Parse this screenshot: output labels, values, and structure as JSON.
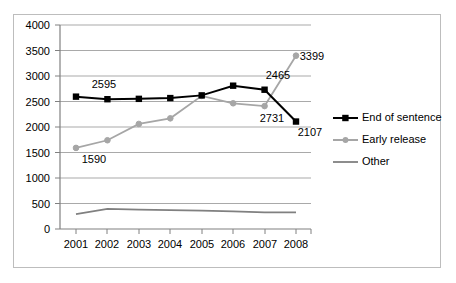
{
  "chart_data": {
    "type": "line",
    "title": "",
    "subtitle": "",
    "xlabel": "",
    "ylabel": "",
    "categories": [
      "2001",
      "2002",
      "2003",
      "2004",
      "2005",
      "2006",
      "2007",
      "2008"
    ],
    "ylim": [
      0,
      4000
    ],
    "y_ticks": [
      "0",
      "500",
      "1000",
      "1500",
      "2000",
      "2500",
      "3000",
      "3500",
      "4000"
    ],
    "y_tick_values": [
      0,
      500,
      1000,
      1500,
      2000,
      2500,
      3000,
      3500,
      4000
    ],
    "grid": true,
    "legend_position": "right",
    "series": [
      {
        "name": "End of sentence",
        "color": "#000000",
        "marker": "square",
        "values": [
          2595,
          2545,
          2552,
          2567,
          2620,
          2810,
          2731,
          2107
        ]
      },
      {
        "name": "Early release",
        "color": "#a6a6a6",
        "marker": "circle",
        "values": [
          1590,
          1740,
          2060,
          2170,
          2610,
          2465,
          2410,
          3399
        ]
      },
      {
        "name": "Other",
        "color": "#808080",
        "marker": "none",
        "values": [
          290,
          395,
          380,
          370,
          360,
          345,
          325,
          325
        ]
      }
    ],
    "annotations": [
      {
        "text": "2595",
        "series": "End of sentence",
        "category": "2001",
        "value": 2595
      },
      {
        "text": "1590",
        "series": "Early release",
        "category": "2001",
        "value": 1590
      },
      {
        "text": "2465",
        "series": "Early release",
        "category": "2007",
        "value": 2465
      },
      {
        "text": "3399",
        "series": "Early release",
        "category": "2008",
        "value": 3399
      },
      {
        "text": "2731",
        "series": "End of sentence",
        "category": "2007",
        "value": 2731
      },
      {
        "text": "2107",
        "series": "End of sentence",
        "category": "2008",
        "value": 2107
      }
    ]
  },
  "legend": {
    "items": [
      {
        "label": "End of sentence"
      },
      {
        "label": "Early release"
      },
      {
        "label": "Other"
      }
    ]
  },
  "axis": {
    "y_labels": [
      "4000",
      "3500",
      "3000",
      "2500",
      "2000",
      "1500",
      "1000",
      "500",
      "0"
    ],
    "x_labels": [
      "2001",
      "2002",
      "2003",
      "2004",
      "2005",
      "2006",
      "2007",
      "2008"
    ]
  },
  "labels": {
    "a_2595": "2595",
    "a_1590": "1590",
    "a_2465": "2465",
    "a_3399": "3399",
    "a_2731": "2731",
    "a_2107": "2107"
  },
  "colors": {
    "end_of_sentence": "#000000",
    "early_release": "#a6a6a6",
    "other": "#808080",
    "gridline": "#a9a9a9",
    "border": "#bdbdbd"
  }
}
